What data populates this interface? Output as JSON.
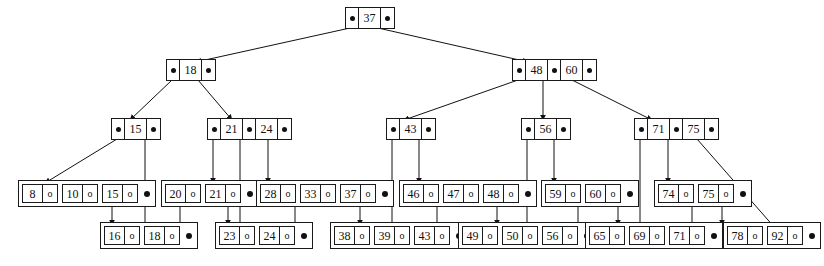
{
  "figure": {
    "kind": "b-plus-tree-diagram",
    "record_pointer_glyph": "o",
    "levels": 4
  },
  "tree": {
    "root": {
      "id": "root-37",
      "keys": [
        "37"
      ],
      "pointers": 2
    },
    "internal_level_1": [
      {
        "id": "node-18",
        "keys": [
          "18"
        ],
        "pointers": 2
      },
      {
        "id": "node-48-60",
        "keys": [
          "48",
          "60"
        ],
        "pointers": 3
      }
    ],
    "internal_level_2": [
      {
        "id": "node-15",
        "keys": [
          "15"
        ],
        "pointers": 2
      },
      {
        "id": "node-21-24",
        "keys": [
          "21",
          "24"
        ],
        "pointers": 3
      },
      {
        "id": "node-43",
        "keys": [
          "43"
        ],
        "pointers": 2
      },
      {
        "id": "node-56",
        "keys": [
          "56"
        ],
        "pointers": 2
      },
      {
        "id": "node-71-75",
        "keys": [
          "71",
          "75"
        ],
        "pointers": 3
      }
    ],
    "leaves": [
      {
        "id": "leaf-8-10-15",
        "keys": [
          "8",
          "10",
          "15"
        ],
        "has_next_pointer": true,
        "row": "upper"
      },
      {
        "id": "leaf-16-18",
        "keys": [
          "16",
          "18"
        ],
        "has_next_pointer": true,
        "row": "lower"
      },
      {
        "id": "leaf-20-21",
        "keys": [
          "20",
          "21"
        ],
        "has_next_pointer": true,
        "row": "upper"
      },
      {
        "id": "leaf-23-24",
        "keys": [
          "23",
          "24"
        ],
        "has_next_pointer": true,
        "row": "lower"
      },
      {
        "id": "leaf-28-33-37",
        "keys": [
          "28",
          "33",
          "37"
        ],
        "has_next_pointer": true,
        "row": "upper"
      },
      {
        "id": "leaf-38-39-43",
        "keys": [
          "38",
          "39",
          "43"
        ],
        "has_next_pointer": true,
        "row": "lower"
      },
      {
        "id": "leaf-46-47-48",
        "keys": [
          "46",
          "47",
          "48"
        ],
        "has_next_pointer": true,
        "row": "upper"
      },
      {
        "id": "leaf-49-50-56",
        "keys": [
          "49",
          "50",
          "56"
        ],
        "has_next_pointer": true,
        "row": "lower"
      },
      {
        "id": "leaf-59-60",
        "keys": [
          "59",
          "60"
        ],
        "has_next_pointer": true,
        "row": "upper"
      },
      {
        "id": "leaf-65-69-71",
        "keys": [
          "65",
          "69",
          "71"
        ],
        "has_next_pointer": true,
        "row": "lower"
      },
      {
        "id": "leaf-74-75",
        "keys": [
          "74",
          "75"
        ],
        "has_next_pointer": true,
        "row": "upper"
      },
      {
        "id": "leaf-78-92",
        "keys": [
          "78",
          "92"
        ],
        "has_next_pointer": true,
        "row": "lower"
      }
    ]
  },
  "keys": {
    "root_37": "37",
    "n18_k0": "18",
    "n4860_k0": "48",
    "n4860_k1": "60",
    "n15_k0": "15",
    "n2124_k0": "21",
    "n2124_k1": "24",
    "n43_k0": "43",
    "n56_k0": "56",
    "n7175_k0": "71",
    "n7175_k1": "75",
    "L1": [
      "8",
      "10",
      "15"
    ],
    "L2": [
      "16",
      "18"
    ],
    "L3": [
      "20",
      "21"
    ],
    "L4": [
      "23",
      "24"
    ],
    "L5": [
      "28",
      "33",
      "37"
    ],
    "L6": [
      "38",
      "39",
      "43"
    ],
    "L7": [
      "46",
      "47",
      "48"
    ],
    "L8": [
      "49",
      "50",
      "56"
    ],
    "L9": [
      "59",
      "60"
    ],
    "L10": [
      "65",
      "69",
      "71"
    ],
    "L11": [
      "74",
      "75"
    ],
    "L12": [
      "78",
      "92"
    ]
  },
  "colors": {
    "ink": "#111111",
    "background": "#ffffff"
  }
}
